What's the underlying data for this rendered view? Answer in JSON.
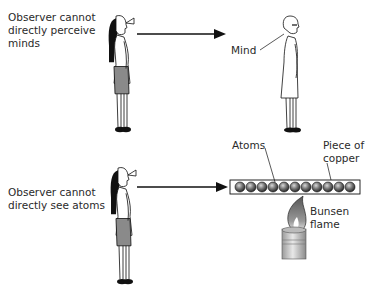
{
  "top_panel": {
    "caption_line1": "Observer cannot",
    "caption_line2": "directly perceive",
    "caption_line3": "minds",
    "target_label": "Mind"
  },
  "bottom_panel": {
    "caption_line1": "Observer cannot",
    "caption_line2": "directly see atoms",
    "atoms_label": "Atoms",
    "copper_label_line1": "Piece of",
    "copper_label_line2": "copper",
    "flame_label_line1": "Bunsen",
    "flame_label_line2": "flame",
    "atom_count": 11
  },
  "colors": {
    "skirt": "#8a8a8a",
    "hair": "#111111",
    "atom": "#6e6e6e",
    "line": "#111111"
  }
}
